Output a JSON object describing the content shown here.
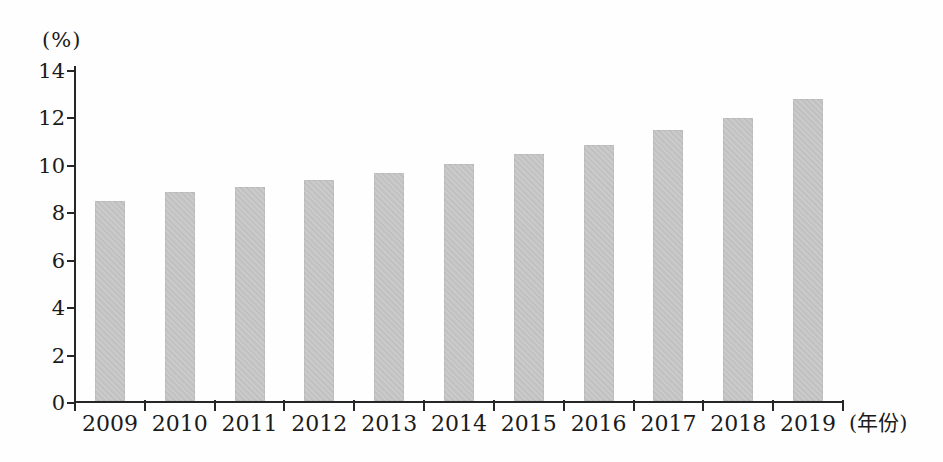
{
  "chart": {
    "y_unit_label": "(%)",
    "x_unit_label": "(年份)"
  },
  "chart_data": {
    "type": "bar",
    "title": "",
    "categories": [
      "2009",
      "2010",
      "2011",
      "2012",
      "2013",
      "2014",
      "2015",
      "2016",
      "2017",
      "2018",
      "2019"
    ],
    "values": [
      8.5,
      8.9,
      9.1,
      9.4,
      9.7,
      10.1,
      10.5,
      10.9,
      11.5,
      12.0,
      12.8
    ],
    "xlabel": "(年份)",
    "ylabel": "(%)",
    "ylim": [
      0,
      14
    ],
    "yticks": [
      0,
      2,
      4,
      6,
      8,
      10,
      12,
      14
    ],
    "grid": false,
    "legend": "none",
    "bar_color": "#c6c6c6",
    "axis_color": "#262626"
  }
}
